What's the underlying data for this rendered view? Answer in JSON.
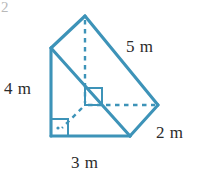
{
  "figure": {
    "name": "triangular-prism",
    "corner_mark": "2",
    "stroke_color": "#3d93b8",
    "dash_color": "#3d93b8",
    "text_color": "#2b2b2b",
    "background": "#ffffff"
  },
  "labels": {
    "slant_edge": "5 m",
    "height_edge": "4 m",
    "depth_edge": "2 m",
    "base_edge": "3 m"
  },
  "geometry": {
    "apex": {
      "x": 85,
      "y": 16
    },
    "front_top_left": {
      "x": 51,
      "y": 48
    },
    "front_bottom_left": {
      "x": 51,
      "y": 136
    },
    "front_bottom_right": {
      "x": 130,
      "y": 136
    },
    "back_right": {
      "x": 158,
      "y": 105
    },
    "hidden_vertex": {
      "x": 85,
      "y": 105
    }
  },
  "markers": {
    "interior_right_angle": "right-angle-square",
    "base_right_angle": "right-angle-square-with-dot"
  }
}
